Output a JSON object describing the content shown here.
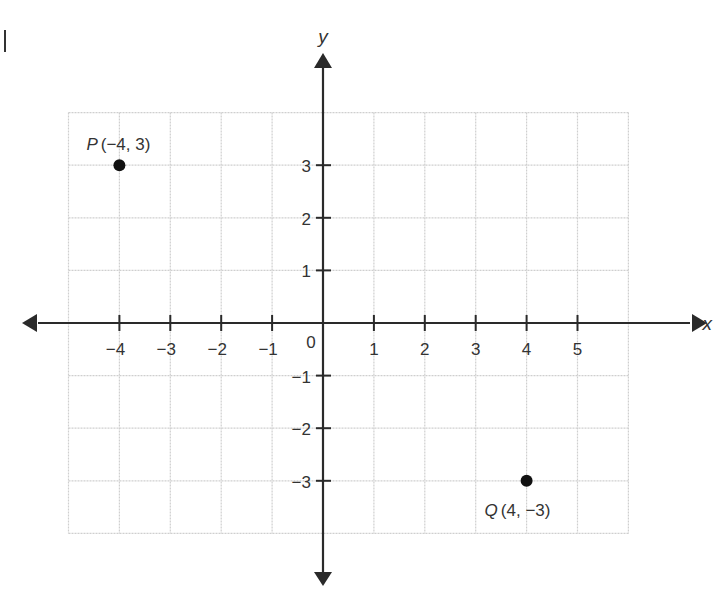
{
  "chart_data": {
    "type": "scatter",
    "title": "",
    "xlabel": "x",
    "ylabel": "y",
    "xlim": [
      -5,
      6
    ],
    "ylim": [
      -4,
      4
    ],
    "grid": true,
    "origin_label": "0",
    "x_ticks": [
      -4,
      -3,
      -2,
      -1,
      1,
      2,
      3,
      4,
      5
    ],
    "x_tick_labels": [
      "−4",
      "−3",
      "−2",
      "−1",
      "1",
      "2",
      "3",
      "4",
      "5"
    ],
    "y_ticks": [
      3,
      2,
      1,
      -1,
      -2,
      -3
    ],
    "y_tick_labels": [
      "3",
      "2",
      "1",
      "−1",
      "−2",
      "−3"
    ],
    "points": [
      {
        "name": "P",
        "x": -4,
        "y": 3,
        "label": "P",
        "coords": "(−4, 3)"
      },
      {
        "name": "Q",
        "x": 4,
        "y": -3,
        "label": "Q",
        "coords": "(4, −3)"
      }
    ]
  },
  "colors": {
    "axis": "#2a2a2a",
    "grid": "#cfcfcf",
    "point": "#111111",
    "text": "#333333"
  }
}
